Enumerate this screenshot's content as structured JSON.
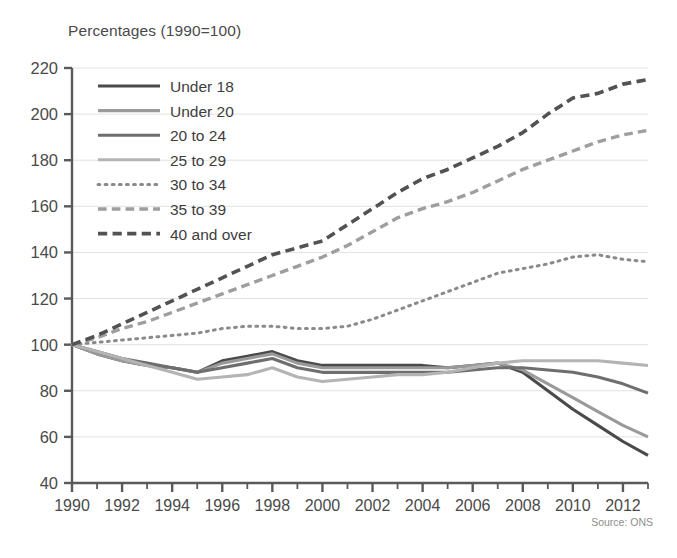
{
  "chart_data": {
    "type": "line",
    "title": "Percentages (1990=100)",
    "xlabel": "",
    "ylabel": "",
    "source": "Source: ONS",
    "xlim": [
      1990,
      2013
    ],
    "ylim": [
      40,
      220
    ],
    "ytick_step": 20,
    "yticks": [
      40,
      60,
      80,
      100,
      120,
      140,
      160,
      180,
      200,
      220
    ],
    "xticks": [
      1990,
      1992,
      1994,
      1996,
      1998,
      2000,
      2002,
      2004,
      2006,
      2008,
      2010,
      2012
    ],
    "xticks_minor_every": 1,
    "grid": "horizontal",
    "legend_position": "top-left",
    "x": [
      1990,
      1991,
      1992,
      1993,
      1994,
      1995,
      1996,
      1997,
      1998,
      1999,
      2000,
      2001,
      2002,
      2003,
      2004,
      2005,
      2006,
      2007,
      2008,
      2009,
      2010,
      2011,
      2012,
      2013
    ],
    "series": [
      {
        "name": "Under 18",
        "style": "solid",
        "color": "#4a4a4a",
        "width": 3.1,
        "values": [
          100,
          96,
          93,
          91,
          90,
          88,
          93,
          95,
          97,
          93,
          91,
          91,
          91,
          91,
          91,
          90,
          91,
          92,
          88,
          80,
          72,
          65,
          58,
          52
        ]
      },
      {
        "name": "Under 20",
        "style": "solid",
        "color": "#9a9a9a",
        "width": 3.1,
        "values": [
          100,
          96,
          93,
          91,
          90,
          88,
          92,
          94,
          96,
          92,
          90,
          90,
          90,
          90,
          90,
          90,
          91,
          92,
          89,
          83,
          77,
          71,
          65,
          60
        ]
      },
      {
        "name": "20 to 24",
        "style": "solid",
        "color": "#6e6e6e",
        "width": 3.1,
        "values": [
          100,
          97,
          94,
          92,
          90,
          88,
          90,
          92,
          94,
          90,
          88,
          88,
          88,
          88,
          88,
          88,
          89,
          90,
          90,
          89,
          88,
          86,
          83,
          79
        ]
      },
      {
        "name": "25 to 29",
        "style": "solid",
        "color": "#b4b4b4",
        "width": 3.1,
        "values": [
          100,
          97,
          94,
          91,
          88,
          85,
          86,
          87,
          90,
          86,
          84,
          85,
          86,
          87,
          87,
          88,
          90,
          92,
          93,
          93,
          93,
          93,
          92,
          91
        ]
      },
      {
        "name": "30 to 34",
        "style": "dotted",
        "color": "#8a8a8a",
        "width": 3.0,
        "values": [
          100,
          101,
          102,
          103,
          104,
          105,
          107,
          108,
          108,
          107,
          107,
          108,
          111,
          115,
          119,
          123,
          127,
          131,
          133,
          135,
          138,
          139,
          137,
          136
        ]
      },
      {
        "name": "35 to 39",
        "style": "dashed",
        "color": "#9e9e9e",
        "width": 3.4,
        "values": [
          100,
          103,
          107,
          110,
          114,
          118,
          122,
          126,
          130,
          134,
          138,
          143,
          149,
          155,
          159,
          162,
          166,
          171,
          176,
          180,
          184,
          188,
          191,
          193
        ]
      },
      {
        "name": "40 and over",
        "style": "dashed",
        "color": "#525252",
        "width": 3.6,
        "values": [
          100,
          104,
          109,
          114,
          119,
          124,
          129,
          134,
          139,
          142,
          145,
          152,
          159,
          166,
          172,
          176,
          181,
          186,
          192,
          200,
          207,
          209,
          213,
          215
        ]
      }
    ]
  },
  "legend": {
    "items": [
      {
        "label": "Under 18"
      },
      {
        "label": "Under 20"
      },
      {
        "label": "20 to 24"
      },
      {
        "label": "25 to 29"
      },
      {
        "label": "30 to 34"
      },
      {
        "label": "35 to 39"
      },
      {
        "label": "40 and over"
      }
    ]
  },
  "axes": {
    "y_labels": [
      "220",
      "200",
      "180",
      "160",
      "140",
      "120",
      "100",
      "80",
      "60",
      "40"
    ],
    "x_labels": [
      "1990",
      "1992",
      "1994",
      "1996",
      "1998",
      "2000",
      "2002",
      "2004",
      "2006",
      "2008",
      "2010",
      "2012"
    ]
  }
}
